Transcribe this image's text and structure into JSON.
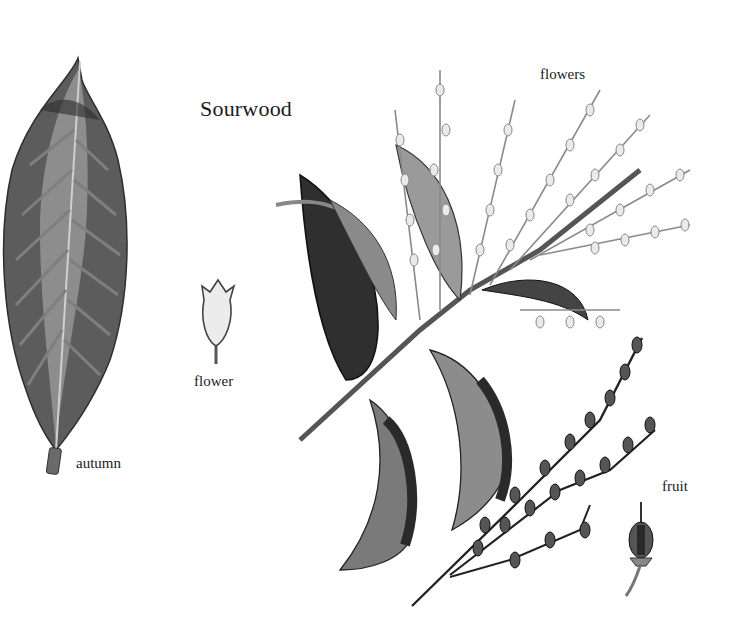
{
  "plate": {
    "title": "Sourwood",
    "labels": {
      "autumn": "autumn",
      "flower": "flower",
      "flowers": "flowers",
      "fruit": "fruit"
    }
  },
  "illustrations": [
    {
      "name": "autumn-leaf",
      "caption": "autumn"
    },
    {
      "name": "single-flower",
      "caption": "flower"
    },
    {
      "name": "flowering-branch",
      "caption": "flowers"
    },
    {
      "name": "fruit-raceme",
      "caption": "fruit"
    },
    {
      "name": "single-fruit",
      "caption": "fruit"
    }
  ],
  "colors": {
    "background": "#ffffff",
    "ink": "#1b1b1b",
    "leaf_dark": "#3a3a3a",
    "leaf_mid": "#6e6e6e",
    "leaf_light": "#a8a8a8",
    "flower_fill": "#e6e6e6"
  }
}
